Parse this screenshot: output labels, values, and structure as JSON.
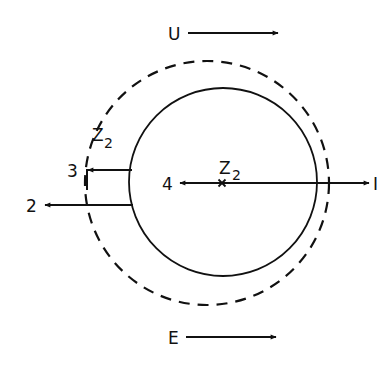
{
  "diagram": {
    "colors": {
      "stroke": "#111111",
      "background": "#ffffff"
    },
    "flow_arrows": {
      "top": {
        "label": "U"
      },
      "bottom": {
        "label": "E"
      }
    },
    "circles": {
      "inner": {
        "style": "solid"
      },
      "outer": {
        "style": "dashed",
        "label": "Z",
        "label_sub": "2"
      }
    },
    "center_point": {
      "marker": "x",
      "label": "Z",
      "label_sub": "2"
    },
    "rays": [
      {
        "id": "1",
        "label": "I"
      },
      {
        "id": "2",
        "label": "2"
      },
      {
        "id": "3",
        "label": "3"
      },
      {
        "id": "4",
        "label": "4"
      }
    ]
  }
}
